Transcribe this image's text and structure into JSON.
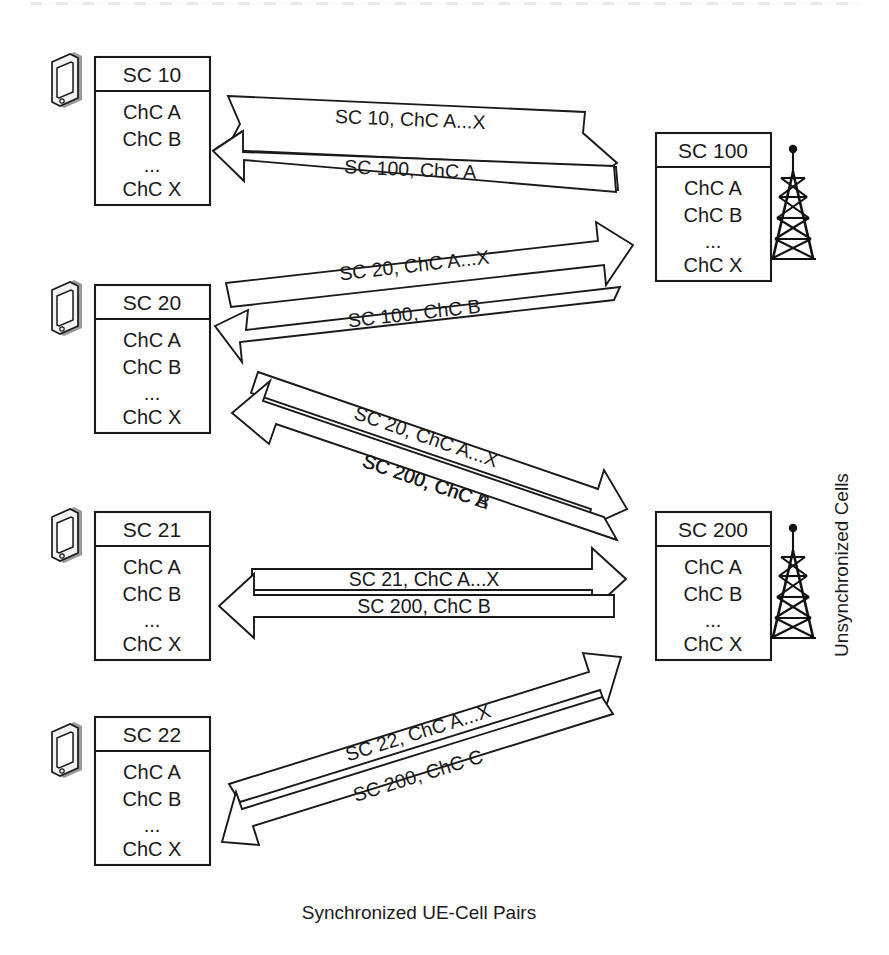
{
  "meta": {
    "background": "#ffffff",
    "ink": "#1a1a1a"
  },
  "labels": {
    "bottom_axis": "Synchronized UE-Cell Pairs",
    "right_axis": "Unsynchronized Cells"
  },
  "ue_boxes": [
    {
      "name": "ue-box-sc10",
      "title": "SC 10",
      "items": [
        "ChC A",
        "ChC B",
        "...",
        "ChC X"
      ]
    },
    {
      "name": "ue-box-sc20",
      "title": "SC 20",
      "items": [
        "ChC A",
        "ChC B",
        "...",
        "ChC X"
      ]
    },
    {
      "name": "ue-box-sc21",
      "title": "SC 21",
      "items": [
        "ChC A",
        "ChC B",
        "...",
        "ChC X"
      ]
    },
    {
      "name": "ue-box-sc22",
      "title": "SC 22",
      "items": [
        "ChC A",
        "ChC B",
        "...",
        "ChC X"
      ]
    }
  ],
  "cell_boxes": [
    {
      "name": "cell-box-sc100",
      "title": "SC 100",
      "items": [
        "ChC A",
        "ChC B",
        "...",
        "ChC X"
      ]
    },
    {
      "name": "cell-box-sc200",
      "title": "SC 200",
      "items": [
        "ChC A",
        "ChC B",
        "...",
        "ChC X"
      ]
    }
  ],
  "flows": [
    {
      "id": "flow-sc10-sc100",
      "from": "SC 10",
      "to": "SC 100",
      "uplink_label": "SC 10, ChC A...X",
      "downlink_label": "SC 100, ChC A"
    },
    {
      "id": "flow-sc20-sc100",
      "from": "SC 20",
      "to": "SC 100",
      "uplink_label": "SC 20, ChC A...X",
      "downlink_label": "SC 100, ChC B"
    },
    {
      "id": "flow-sc20-sc200",
      "from": "SC 20",
      "to": "SC 200",
      "uplink_label": "SC 20, ChC A...X",
      "downlink_label": "SC 200, ChC A"
    },
    {
      "id": "flow-sc21-sc200",
      "from": "SC 21",
      "to": "SC 200",
      "uplink_label": "SC 21, ChC A...X",
      "downlink_label": "SC 200, ChC B"
    },
    {
      "id": "flow-sc22-sc200",
      "from": "SC 22",
      "to": "SC 200",
      "uplink_label": "SC 22, ChC A...X",
      "downlink_label": "SC 200, ChC C"
    }
  ],
  "icons": {
    "ue_device": "mobile-device-icon",
    "cell_tower": "cell-tower-icon"
  }
}
